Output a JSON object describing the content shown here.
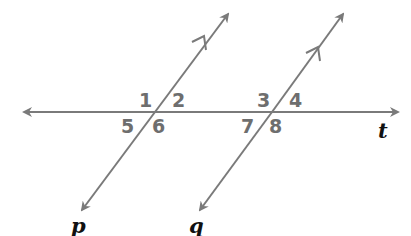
{
  "diagram": {
    "colors": {
      "line": "#7a7a7a",
      "angle_label": "#6e6e6e",
      "line_label": "#111111",
      "background": "#ffffff"
    },
    "lines": {
      "transversal": {
        "label": "t",
        "from": [
          24,
          112
        ],
        "to": [
          398,
          112
        ]
      },
      "p": {
        "label": "p",
        "from": [
          80,
          210
        ],
        "to": [
          228,
          14
        ],
        "parallel_mark": true
      },
      "q": {
        "label": "q",
        "from": [
          198,
          210
        ],
        "to": [
          343,
          14
        ],
        "parallel_mark": true
      }
    },
    "angles": [
      {
        "id": "1",
        "label": "1"
      },
      {
        "id": "2",
        "label": "2"
      },
      {
        "id": "3",
        "label": "3"
      },
      {
        "id": "4",
        "label": "4"
      },
      {
        "id": "5",
        "label": "5"
      },
      {
        "id": "6",
        "label": "6"
      },
      {
        "id": "7",
        "label": "7"
      },
      {
        "id": "8",
        "label": "8"
      }
    ],
    "line_labels": {
      "p": "p",
      "q": "q",
      "t": "t"
    }
  }
}
